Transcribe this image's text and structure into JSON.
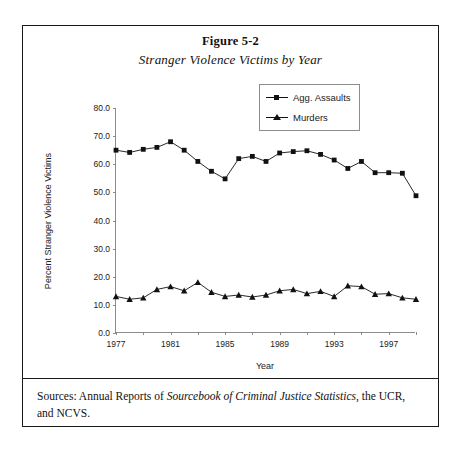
{
  "figure": {
    "number": "Figure 5-2",
    "subtitle": "Stranger Violence Victims by Year",
    "sources_prefix": "Sources: Annual Reports of ",
    "sources_italic": "Sourcebook of Criminal Justice Statistics",
    "sources_suffix": ", the UCR, and NCVS."
  },
  "legend": {
    "items": [
      {
        "label": "Agg. Assaults",
        "marker": "square-marker",
        "color": "#111111"
      },
      {
        "label": "Murders",
        "marker": "triangle-marker",
        "color": "#111111"
      }
    ]
  },
  "chart_data": {
    "type": "line",
    "title": "Stranger Violence Victims by Year",
    "xlabel": "Year",
    "ylabel": "Percent Stranger Violence Victims",
    "xlim": [
      1977,
      1999
    ],
    "ylim": [
      0,
      80
    ],
    "ytick_labels": [
      "0.0",
      "10.0",
      "20.0",
      "30.0",
      "40.0",
      "50.0",
      "60.0",
      "70.0",
      "80.0"
    ],
    "yticks": [
      0,
      10,
      20,
      30,
      40,
      50,
      60,
      70,
      80
    ],
    "xtick_labels": [
      "1977",
      "1981",
      "1985",
      "1989",
      "1993",
      "1997"
    ],
    "xticks": [
      1977,
      1981,
      1985,
      1989,
      1993,
      1997
    ],
    "minor_xticks": [
      1979,
      1983,
      1987,
      1991,
      1995,
      1999
    ],
    "grid": false,
    "legend_position": "top-right",
    "x": [
      1977,
      1978,
      1979,
      1980,
      1981,
      1982,
      1983,
      1984,
      1985,
      1986,
      1987,
      1988,
      1989,
      1990,
      1991,
      1992,
      1993,
      1994,
      1995,
      1996,
      1997,
      1998,
      1999
    ],
    "series": [
      {
        "name": "Agg. Assaults",
        "marker": "square",
        "color": "#111111",
        "values": [
          65.0,
          64.2,
          65.3,
          66.0,
          68.0,
          65.0,
          61.0,
          57.5,
          54.8,
          62.0,
          62.8,
          61.0,
          64.0,
          64.5,
          64.8,
          63.5,
          61.5,
          58.5,
          61.0,
          57.0,
          57.0,
          56.8,
          48.8
        ]
      },
      {
        "name": "Murders",
        "marker": "triangle",
        "color": "#111111",
        "values": [
          13.0,
          12.0,
          12.5,
          15.5,
          16.5,
          15.0,
          18.0,
          14.5,
          13.0,
          13.5,
          12.8,
          13.5,
          15.0,
          15.5,
          14.0,
          14.8,
          13.0,
          16.8,
          16.5,
          13.8,
          14.0,
          12.5,
          12.0
        ]
      }
    ]
  }
}
